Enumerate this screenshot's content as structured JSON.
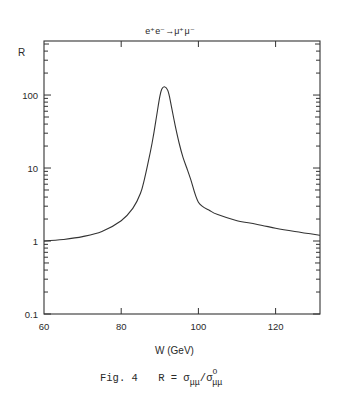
{
  "chart_data": {
    "type": "line",
    "title": "e⁺e⁻→μ⁺μ⁻",
    "xlabel": "W (GeV)",
    "ylabel": "R",
    "xlim": [
      60,
      131.5
    ],
    "ylim": [
      0.1,
      550
    ],
    "yscale": "log",
    "grid": false,
    "legend": null,
    "x_ticks": [
      60,
      80,
      100,
      120
    ],
    "x_tick_labels": [
      "60",
      "80",
      "100",
      "120"
    ],
    "y_ticks": [
      0.1,
      1,
      10,
      100
    ],
    "y_tick_labels": [
      "0.1",
      "1",
      "10",
      "100"
    ],
    "series": [
      {
        "name": "R = σμμ/σ⁰μμ",
        "x": [
          60,
          65,
          70,
          75,
          80,
          83,
          85,
          86,
          87,
          88,
          89,
          90,
          90.5,
          91.2,
          92,
          92.5,
          93,
          94,
          95,
          96,
          97,
          98,
          100,
          103,
          105,
          110,
          115,
          120,
          125,
          131.5
        ],
        "y": [
          1.0,
          1.05,
          1.15,
          1.35,
          1.9,
          2.8,
          4.5,
          7.0,
          12,
          22,
          45,
          95,
          120,
          130,
          118,
          95,
          70,
          38,
          22,
          14,
          10,
          7.0,
          3.4,
          2.6,
          2.3,
          1.9,
          1.7,
          1.5,
          1.35,
          1.2
        ]
      }
    ]
  },
  "figure": {
    "title": "e⁺e⁻→μ⁺μ⁻",
    "y_axis_label": "R",
    "x_axis_label": "W (GeV)",
    "caption_prefix": "Fig. 4",
    "caption_formula": "R = σ",
    "caption_sub": "μμ",
    "caption_slash": "/σ",
    "caption_sup": "O",
    "caption_sub2": "μμ"
  }
}
